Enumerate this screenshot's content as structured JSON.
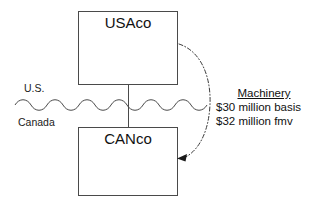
{
  "diagram": {
    "type": "tax-structure-diagram",
    "entities": [
      {
        "id": "usaco",
        "label": "USAco",
        "box": {
          "x": 78,
          "y": 11,
          "w": 100,
          "h": 74
        }
      },
      {
        "id": "canco",
        "label": "CANco",
        "box": {
          "x": 78,
          "y": 127,
          "w": 100,
          "h": 69
        }
      }
    ],
    "regions": {
      "upper": "U.S.",
      "lower": "Canada"
    },
    "border": {
      "style": "wavy-line",
      "y": 105,
      "x_start": 15,
      "x_end": 207
    },
    "ownership_connector": {
      "from": "usaco",
      "to": "canco",
      "style": "solid-vertical",
      "x": 128
    },
    "transfer_arrow": {
      "from": "usaco",
      "to": "canco",
      "style": "dash-dot-arc",
      "direction": "down",
      "arrowhead": "at-canco"
    },
    "annotation": {
      "title": "Machinery",
      "lines": [
        "$30 million basis",
        "$32 million fmv"
      ]
    },
    "colors": {
      "stroke": "#4a4a4a",
      "text": "#111111",
      "background": "#ffffff"
    }
  }
}
